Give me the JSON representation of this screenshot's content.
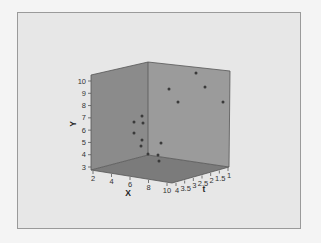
{
  "chart_data": {
    "type": "scatter",
    "subtype": "3d",
    "title": "",
    "xlabel": "X",
    "ylabel": "Y",
    "zlabel": "t",
    "x_ticks": [
      "2",
      "4",
      "6",
      "8",
      "10"
    ],
    "y_ticks": [
      "3",
      "4",
      "5",
      "6",
      "7",
      "8",
      "9",
      "10"
    ],
    "z_ticks": [
      "4",
      "3.5",
      "3",
      "2.5",
      "2",
      "1.5",
      "1"
    ],
    "xlim": [
      2,
      10
    ],
    "ylim": [
      3,
      10
    ],
    "zlim": [
      1,
      4
    ],
    "grid": false,
    "legend": false,
    "points_screen": [
      {
        "px": 196,
        "py": 73
      },
      {
        "px": 169,
        "py": 89
      },
      {
        "px": 205,
        "py": 87
      },
      {
        "px": 178,
        "py": 102
      },
      {
        "px": 223,
        "py": 102
      },
      {
        "px": 134,
        "py": 122
      },
      {
        "px": 142,
        "py": 116
      },
      {
        "px": 143,
        "py": 123
      },
      {
        "px": 134,
        "py": 133
      },
      {
        "px": 142,
        "py": 140
      },
      {
        "px": 141,
        "py": 146
      },
      {
        "px": 161,
        "py": 143
      },
      {
        "px": 148,
        "py": 154
      },
      {
        "px": 158,
        "py": 155
      },
      {
        "px": 159,
        "py": 161
      }
    ]
  },
  "colors": {
    "background": "#e7e7e7",
    "left_wall": "#8b8b8b",
    "right_wall": "#9b9b9b",
    "floor": "#7b7b7b",
    "edge": "#555555",
    "point": "#3a3a3a"
  }
}
